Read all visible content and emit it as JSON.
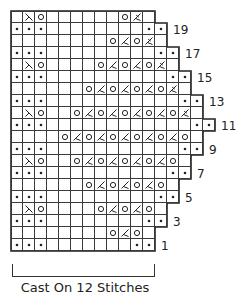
{
  "diagram": {
    "type": "knitting-chart",
    "grid": {
      "left": 11,
      "top": 11,
      "cell_size": 12
    },
    "colors": {
      "grid_line": "#3a3a3a",
      "outline": "#222222",
      "symbol": "#222222"
    },
    "legend_symbols": {
      ".": "purl-dot",
      "o": "yarn-over",
      "/": "k2tog",
      "\\": "ssk",
      "k": "sk2p-decrease",
      "_": "knit-blank"
    },
    "rows": [
      {
        "row": 20,
        "width": 12,
        "label": "",
        "stitches": "_\\o______o k_"
      },
      {
        "row": 19,
        "width": 13,
        "label": "19",
        "stitches": ""
      },
      {
        "row": 18,
        "width": 13,
        "label": "",
        "stitches": ""
      },
      {
        "row": 17,
        "width": 14,
        "label": "17",
        "stitches": ""
      },
      {
        "row": 16,
        "width": 14,
        "label": "",
        "stitches": ""
      },
      {
        "row": 15,
        "width": 15,
        "label": "15",
        "stitches": ""
      },
      {
        "row": 14,
        "width": 15,
        "label": "",
        "stitches": ""
      },
      {
        "row": 13,
        "width": 16,
        "label": "13",
        "stitches": ""
      },
      {
        "row": 12,
        "width": 16,
        "label": "",
        "stitches": ""
      },
      {
        "row": 11,
        "width": 17,
        "label": "11",
        "stitches": ""
      },
      {
        "row": 10,
        "width": 16,
        "label": "",
        "stitches": ""
      },
      {
        "row": 9,
        "width": 16,
        "label": "9",
        "stitches": ""
      },
      {
        "row": 8,
        "width": 15,
        "label": "",
        "stitches": ""
      },
      {
        "row": 7,
        "width": 15,
        "label": "7",
        "stitches": ""
      },
      {
        "row": 6,
        "width": 14,
        "label": "",
        "stitches": ""
      },
      {
        "row": 5,
        "width": 14,
        "label": "5",
        "stitches": ""
      },
      {
        "row": 4,
        "width": 13,
        "label": "",
        "stitches": ""
      },
      {
        "row": 3,
        "width": 13,
        "label": "3",
        "stitches": ""
      },
      {
        "row": 2,
        "width": 12,
        "label": "",
        "stitches": ""
      },
      {
        "row": 1,
        "width": 12,
        "label": "1",
        "stitches": ""
      }
    ],
    "cells": {
      "20": [
        "",
        "ssk",
        "yo",
        "",
        "",
        "",
        "",
        "",
        "",
        "yo",
        "sk2p",
        ""
      ],
      "19": [
        "dot",
        "dot",
        "dot",
        "",
        "",
        "",
        "",
        "",
        "",
        "",
        "",
        "dot",
        "dot"
      ],
      "18": [
        "",
        "",
        "",
        "",
        "",
        "",
        "",
        "",
        "yo",
        "k2tog",
        "yo",
        "sk2p",
        ""
      ],
      "17": [
        "dot",
        "dot",
        "dot",
        "",
        "",
        "",
        "",
        "",
        "",
        "",
        "",
        "",
        "dot",
        "dot"
      ],
      "16": [
        "",
        "ssk",
        "yo",
        "",
        "",
        "",
        "",
        "yo",
        "k2tog",
        "yo",
        "k2tog",
        "yo",
        "sk2p",
        ""
      ],
      "15": [
        "dot",
        "dot",
        "dot",
        "",
        "",
        "",
        "",
        "",
        "",
        "",
        "",
        "",
        "",
        "dot",
        "dot"
      ],
      "14": [
        "",
        "",
        "",
        "",
        "",
        "",
        "yo",
        "k2tog",
        "yo",
        "k2tog",
        "yo",
        "k2tog",
        "yo",
        "sk2p",
        ""
      ],
      "13": [
        "dot",
        "dot",
        "dot",
        "",
        "",
        "",
        "",
        "",
        "",
        "",
        "",
        "",
        "",
        "",
        "dot",
        "dot"
      ],
      "12": [
        "",
        "ssk",
        "yo",
        "",
        "",
        "yo",
        "k2tog",
        "yo",
        "k2tog",
        "yo",
        "k2tog",
        "yo",
        "k2tog",
        "yo",
        "sk2p",
        ""
      ],
      "11": [
        "dot",
        "dot",
        "dot",
        "",
        "",
        "",
        "",
        "",
        "",
        "",
        "",
        "",
        "",
        "",
        "",
        "dot",
        "dot"
      ],
      "10": [
        "",
        "",
        "",
        "",
        "yo",
        "k2tog",
        "yo",
        "k2tog",
        "yo",
        "k2tog",
        "yo",
        "k2tog",
        "yo",
        "k2tog",
        "yo",
        ""
      ],
      "9": [
        "dot",
        "dot",
        "dot",
        "",
        "",
        "",
        "",
        "",
        "",
        "",
        "",
        "",
        "",
        "",
        "dot",
        "dot"
      ],
      "8": [
        "",
        "ssk",
        "yo",
        "",
        "",
        "yo",
        "k2tog",
        "yo",
        "k2tog",
        "yo",
        "k2tog",
        "yo",
        "k2tog",
        "yo",
        ""
      ],
      "7": [
        "dot",
        "dot",
        "dot",
        "",
        "",
        "",
        "",
        "",
        "",
        "",
        "",
        "",
        "",
        "dot",
        "dot"
      ],
      "6": [
        "",
        "",
        "",
        "",
        "",
        "",
        "yo",
        "k2tog",
        "yo",
        "k2tog",
        "yo",
        "k2tog",
        "yo",
        ""
      ],
      "5": [
        "dot",
        "dot",
        "dot",
        "",
        "",
        "",
        "",
        "",
        "",
        "",
        "",
        "",
        "dot",
        "dot"
      ],
      "4": [
        "",
        "ssk",
        "yo",
        "",
        "",
        "",
        "",
        "yo",
        "k2tog",
        "yo",
        "k2tog",
        "yo",
        ""
      ],
      "3": [
        "dot",
        "dot",
        "dot",
        "",
        "",
        "",
        "",
        "",
        "",
        "",
        "",
        "dot",
        "dot"
      ],
      "2": [
        "",
        "",
        "",
        "",
        "",
        "",
        "",
        "",
        "yo",
        "k2tog",
        "yo",
        ""
      ],
      "1": [
        "dot",
        "dot",
        "dot",
        "",
        "",
        "",
        "",
        "",
        "",
        "",
        "dot",
        "dot"
      ]
    },
    "caption": "Cast On 12 Stitches"
  }
}
